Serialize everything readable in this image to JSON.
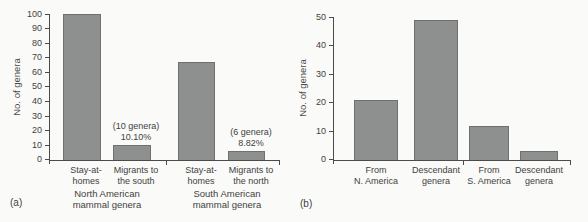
{
  "figure": {
    "panel_a_label": "(a)",
    "panel_b_label": "(b)",
    "background_color": "#fafaf8",
    "bar_color": "#8e9090",
    "bar_border_color": "#6f7171",
    "axis_color": "#4b4b4b",
    "text_color": "#3c3c3c"
  },
  "chart_data": [
    {
      "type": "bar",
      "panel": "a",
      "ylabel": "No. of genera",
      "xlabel": "",
      "ylim": [
        0,
        100
      ],
      "yticks": [
        0,
        10,
        20,
        30,
        40,
        50,
        60,
        70,
        80,
        90,
        100
      ],
      "categories": [
        "Stay-at-homes",
        "Migrants to the south",
        "Stay-at-homes",
        "Migrants to the north"
      ],
      "category_lines": [
        [
          "Stay-at-",
          "homes"
        ],
        [
          "Migrants to",
          "the south"
        ],
        [
          "Stay-at-",
          "homes"
        ],
        [
          "Migrants to",
          "the north"
        ]
      ],
      "values": [
        100,
        10,
        67,
        6
      ],
      "annotations": [
        {
          "bar_index": 1,
          "lines": [
            "(10 genera)",
            "10.10%"
          ]
        },
        {
          "bar_index": 3,
          "lines": [
            "(6 genera)",
            "8.82%"
          ]
        }
      ],
      "group_labels": [
        [
          "North American",
          "mammal genera"
        ],
        [
          "South American",
          "mammal genera"
        ]
      ],
      "grid": false,
      "legend": false
    },
    {
      "type": "bar",
      "panel": "b",
      "ylabel": "No. of genera",
      "xlabel": "",
      "ylim": [
        0,
        50
      ],
      "yticks": [
        0,
        10,
        20,
        30,
        40,
        50
      ],
      "categories": [
        "From N. America",
        "Descendant genera",
        "From S. America",
        "Descendant genera"
      ],
      "category_lines": [
        [
          "From",
          "N. America"
        ],
        [
          "Descendant",
          "genera"
        ],
        [
          "From",
          "S. America"
        ],
        [
          "Descendant",
          "genera"
        ]
      ],
      "values": [
        21,
        49,
        12,
        3
      ],
      "annotations": [],
      "group_labels": [],
      "grid": false,
      "legend": false
    }
  ]
}
